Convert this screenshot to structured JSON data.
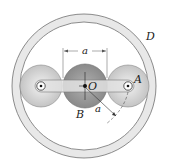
{
  "diagram": {
    "labels": {
      "ring": "D",
      "center_gear": "B",
      "center_point": "O",
      "planet_pin": "A",
      "dimension_top": "a",
      "dimension_radius": "a"
    },
    "colors": {
      "background": "#ffffff",
      "ring_fill": "#e6e6e6",
      "ring_stroke": "#6e6e6e",
      "planet_fill": "#cfcfcf",
      "sun_fill": "#9a9a9a",
      "arm_fill": "#e4e4e4",
      "line": "#222222"
    }
  }
}
